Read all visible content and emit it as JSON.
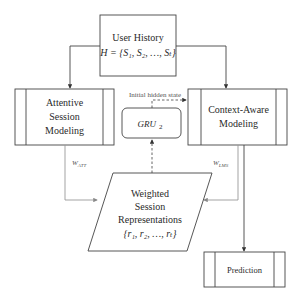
{
  "diagram": {
    "nodes": {
      "user_history": {
        "title": "User History",
        "formula": "H = {S₁, S₂, …, Sₜ}"
      },
      "attentive": {
        "line1": "Attentive",
        "line2": "Session",
        "line3": "Modeling"
      },
      "context_aware": {
        "line1": "Context-Aware",
        "line2": "Modeling"
      },
      "gru": {
        "label": "GRU",
        "subscript": "2"
      },
      "weighted": {
        "line1": "Weighted",
        "line2": "Session",
        "line3": "Representations",
        "formula": "{r₁, r₂, …, rₜ}"
      },
      "prediction": {
        "label": "Prediction"
      }
    },
    "edges": {
      "initial_hidden_state": "Initial hidden state",
      "w_att": "W",
      "w_att_sub": "ATT",
      "w_lms": "W",
      "w_lms_sub": "LMS"
    },
    "colors": {
      "stroke": "#444444",
      "light_stroke": "#999999",
      "text": "#2a2a2a"
    }
  }
}
